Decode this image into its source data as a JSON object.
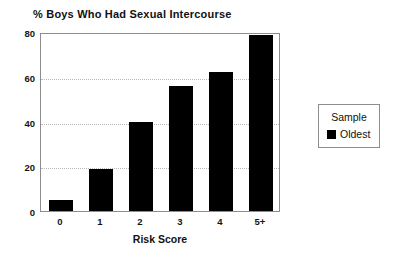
{
  "chart_data": {
    "type": "bar",
    "title": "% Boys Who Had Sexual Intercourse",
    "xlabel": "Risk Score",
    "ylabel": "",
    "categories": [
      "0",
      "1",
      "2",
      "3",
      "4",
      "5+"
    ],
    "values": [
      5,
      19,
      40,
      56,
      62,
      78.5
    ],
    "series": [
      {
        "name": "Oldest",
        "values": [
          5,
          19,
          40,
          56,
          62,
          78.5
        ],
        "color": "#000000"
      }
    ],
    "ylim": [
      0,
      80
    ],
    "yticks": [
      0,
      20,
      40,
      60,
      80
    ],
    "ytick_labels": [
      "0",
      "20",
      "40",
      "60",
      "80"
    ],
    "grid": "horizontal-dotted",
    "legend_position": "right-outside",
    "legend": {
      "title": "Sample",
      "entries": [
        {
          "label": "Oldest",
          "color": "#000000"
        }
      ]
    }
  },
  "colors": {
    "bar": "#000000",
    "frame": "#8d8d8d",
    "grid": "#b9b9b9",
    "text": "#111111",
    "background": "#ffffff"
  }
}
